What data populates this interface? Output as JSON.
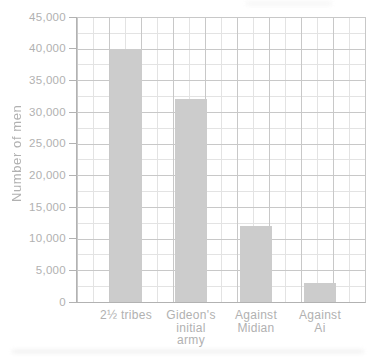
{
  "chart_data": {
    "type": "bar",
    "title": "",
    "xlabel": "",
    "ylabel": "Number of men",
    "categories": [
      "2½ tribes",
      "Gideon's initial army",
      "Against Midian",
      "Against Ai"
    ],
    "category_lines": [
      [
        "2½ tribes"
      ],
      [
        "Gideon's",
        "initial",
        "army"
      ],
      [
        "Against",
        "Midian"
      ],
      [
        "Against",
        "Ai"
      ]
    ],
    "values": [
      40000,
      32000,
      12000,
      3000
    ],
    "ylim": [
      0,
      45000
    ],
    "ytick_interval": 5000,
    "minor_grid_interval": 2500,
    "ytick_labels": [
      "45,000",
      "40,000",
      "35,000",
      "30,000",
      "25,000",
      "20,000",
      "15,000",
      "10,000",
      "5,000",
      "0"
    ],
    "grid": true,
    "legend": false,
    "colors": {
      "bar": "#cccccc",
      "grid_minor": "#e3e3e3",
      "grid_major": "#c8c8c8",
      "axis": "#b2b2b2",
      "text": "#b1b1b1",
      "background": "#ffffff"
    }
  }
}
